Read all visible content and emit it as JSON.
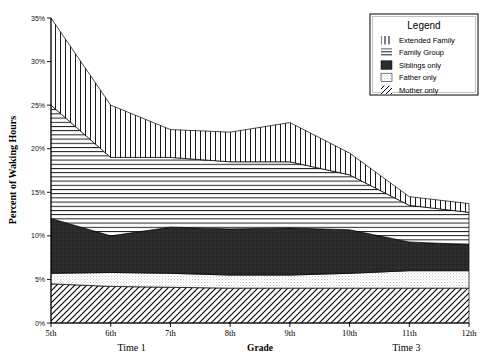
{
  "chart_data": {
    "type": "area",
    "title": "",
    "xlabel": "Grade",
    "ylabel": "Percent of Waking Hours",
    "ylim": [
      0,
      35
    ],
    "ytick_labels": [
      "0%",
      "5%",
      "10%",
      "15%",
      "20%",
      "25%",
      "30%",
      "35%"
    ],
    "ytick_values": [
      0,
      5,
      10,
      15,
      20,
      25,
      30,
      35
    ],
    "categories": [
      "5th",
      "6th",
      "7th",
      "8th",
      "9th",
      "10th",
      "11th",
      "12th"
    ],
    "x": [
      5,
      6,
      7,
      8,
      9,
      10,
      11,
      12
    ],
    "grid": false,
    "legend_position": "top-right",
    "legend_title": "Legend",
    "stacked": true,
    "stack_order_bottom_to_top": [
      "Mother only",
      "Father only",
      "Siblings only",
      "Family Group",
      "Extended Family"
    ],
    "series": [
      {
        "name": "Mother only",
        "pattern": "diagonal-lines",
        "values": [
          4.5,
          4.2,
          4.1,
          4.0,
          4.0,
          4.0,
          4.0,
          4.0
        ]
      },
      {
        "name": "Father only",
        "pattern": "light-stipple",
        "values": [
          1.2,
          1.6,
          1.6,
          1.5,
          1.5,
          1.7,
          2.0,
          2.0
        ]
      },
      {
        "name": "Siblings only",
        "pattern": "solid-dark",
        "values": [
          6.3,
          4.2,
          5.3,
          5.3,
          5.4,
          5.0,
          3.3,
          3.0
        ]
      },
      {
        "name": "Family Group",
        "pattern": "horizontal-lines",
        "values": [
          13.0,
          9.0,
          8.0,
          7.7,
          7.6,
          6.3,
          4.2,
          3.7
        ]
      },
      {
        "name": "Extended Family",
        "pattern": "vertical-lines",
        "values": [
          10.0,
          6.0,
          3.2,
          3.4,
          4.5,
          2.5,
          1.0,
          1.0
        ]
      }
    ],
    "cumulative_top_percent": [
      35.0,
      25.0,
      22.2,
      21.9,
      23.0,
      19.5,
      14.5,
      13.7
    ],
    "annotations": [
      {
        "text": "Time 1",
        "x_grade": 6.35,
        "position": "below-axis"
      },
      {
        "text": "Time 3",
        "x_grade": 10.95,
        "position": "below-axis"
      }
    ]
  },
  "axis": {
    "y_title": "Percent of Waking Hours",
    "x_title": "Grade"
  },
  "legend": {
    "title": "Legend",
    "items": [
      {
        "label": "Extended Family",
        "swatch": "vertical-lines-icon"
      },
      {
        "label": "Family Group",
        "swatch": "horizontal-lines-icon"
      },
      {
        "label": "Siblings only",
        "swatch": "solid-dark-icon"
      },
      {
        "label": "Father only",
        "swatch": "light-stipple-icon"
      },
      {
        "label": "Mother only",
        "swatch": "diagonal-lines-icon"
      }
    ]
  },
  "colors": {
    "ink": "#000000",
    "solid_dark": "#2b2b2b",
    "stipple_light": "#e8e8e8",
    "background": "#ffffff"
  }
}
